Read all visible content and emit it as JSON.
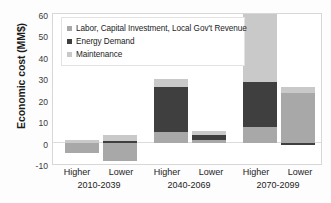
{
  "chart_data": {
    "type": "bar",
    "subtype": "stacked-bar-grouped",
    "title": "",
    "xlabel": "",
    "ylabel": "Economic cost (MM$)",
    "ylim": [
      -10,
      60
    ],
    "yticks": [
      60,
      50,
      40,
      30,
      20,
      10,
      0,
      -10
    ],
    "ytick_labels": [
      "60",
      "50",
      "40",
      "30",
      "20",
      "10",
      "0",
      "-10"
    ],
    "grid": false,
    "legend_position": "upper-left-inside",
    "groups": [
      {
        "period": "2010-2039",
        "scenarios": [
          "Higher",
          "Lower"
        ]
      },
      {
        "period": "2040-2069",
        "scenarios": [
          "Higher",
          "Lower"
        ]
      },
      {
        "period": "2070-2099",
        "scenarios": [
          "Higher",
          "Lower"
        ]
      }
    ],
    "categories": [
      "Higher 2010-2039",
      "Lower 2010-2039",
      "Higher 2040-2069",
      "Lower 2040-2069",
      "Higher 2070-2099",
      "Lower 2070-2099"
    ],
    "series": [
      {
        "name": "Labor, Capital Investment, Local Gov't Revenue",
        "color": "#a8a8a8",
        "values": [
          -5.0,
          -8.5,
          5.0,
          1.0,
          7.5,
          23.0
        ]
      },
      {
        "name": "Energy Demand",
        "color": "#3f3f3f",
        "values": [
          0.0,
          0.8,
          21.0,
          2.5,
          21.0,
          -1.0
        ]
      },
      {
        "name": "Maintenance",
        "color": "#c9c9c9",
        "values": [
          1.3,
          2.6,
          3.5,
          2.0,
          31.5,
          3.0
        ]
      }
    ],
    "bar_totals": [
      -3.7,
      -5.1,
      29.5,
      5.5,
      60.0,
      25.0
    ]
  },
  "legend": {
    "items": [
      {
        "label": "Labor, Capital Investment, Local Gov't Revenue",
        "swatch": "#a8a8a8"
      },
      {
        "label": "Energy Demand",
        "swatch": "#3f3f3f"
      },
      {
        "label": "Maintenance",
        "swatch": "#c9c9c9"
      }
    ]
  },
  "axes": {
    "y_title": "Economic cost (MM$)",
    "y_ticks": [
      "60",
      "50",
      "40",
      "30",
      "20",
      "10",
      "0",
      "-10"
    ],
    "x_groups": [
      {
        "left": "Higher",
        "right": "Lower",
        "period": "2010-2039"
      },
      {
        "left": "Higher",
        "right": "Lower",
        "period": "2040-2069"
      },
      {
        "left": "Higher",
        "right": "Lower",
        "period": "2070-2099"
      }
    ]
  }
}
